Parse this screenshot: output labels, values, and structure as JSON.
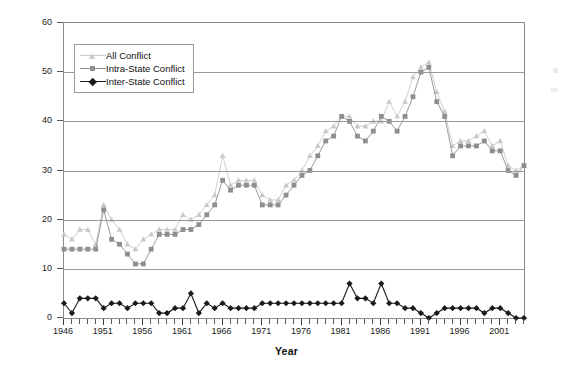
{
  "chart_data": {
    "type": "line",
    "title": "",
    "xlabel": "Year",
    "ylabel": "Number of Conflicts",
    "xlim": [
      1946,
      2004
    ],
    "ylim": [
      0,
      60
    ],
    "ytick_step": 10,
    "yticks": [
      0,
      10,
      20,
      30,
      40,
      50,
      60
    ],
    "xticks_labeled": [
      1946,
      1951,
      1956,
      1961,
      1966,
      1971,
      1976,
      1981,
      1986,
      1991,
      1996,
      2001
    ],
    "xtick_step": 1,
    "grid": "horizontal",
    "legend_position": "top-left",
    "x": [
      1946,
      1947,
      1948,
      1949,
      1950,
      1951,
      1952,
      1953,
      1954,
      1955,
      1956,
      1957,
      1958,
      1959,
      1960,
      1961,
      1962,
      1963,
      1964,
      1965,
      1966,
      1967,
      1968,
      1969,
      1970,
      1971,
      1972,
      1973,
      1974,
      1975,
      1976,
      1977,
      1978,
      1979,
      1980,
      1981,
      1982,
      1983,
      1984,
      1985,
      1986,
      1987,
      1988,
      1989,
      1990,
      1991,
      1992,
      1993,
      1994,
      1995,
      1996,
      1997,
      1998,
      1999,
      2000,
      2001,
      2002,
      2003,
      2004
    ],
    "series": [
      {
        "name": "All Conflict",
        "color": "#c9c9cd",
        "marker": "triangle",
        "values": [
          17,
          16,
          18,
          18,
          15,
          23,
          20,
          18,
          15,
          14,
          16,
          17,
          18,
          18,
          18,
          21,
          20,
          21,
          23,
          25,
          33,
          27,
          28,
          28,
          28,
          25,
          24,
          24,
          27,
          28,
          30,
          33,
          35,
          38,
          39,
          41,
          41,
          39,
          39,
          40,
          40,
          44,
          41,
          44,
          49,
          51,
          52,
          46,
          42,
          35,
          36,
          36,
          37,
          38,
          35,
          36,
          31,
          30,
          31
        ]
      },
      {
        "name": "Intra-State Conflict",
        "color": "#8e8e92",
        "marker": "square",
        "values": [
          14,
          14,
          14,
          14,
          14,
          22,
          16,
          15,
          13,
          11,
          11,
          14,
          17,
          17,
          17,
          18,
          18,
          19,
          21,
          23,
          28,
          26,
          27,
          27,
          27,
          23,
          23,
          23,
          25,
          27,
          29,
          30,
          33,
          36,
          37,
          41,
          40,
          37,
          36,
          38,
          41,
          40,
          38,
          41,
          45,
          50,
          51,
          44,
          41,
          33,
          35,
          35,
          35,
          36,
          34,
          34,
          30,
          29,
          31
        ]
      },
      {
        "name": "Inter-State Conflict",
        "color": "#1b1b1b",
        "marker": "diamond",
        "values": [
          3,
          1,
          4,
          4,
          4,
          2,
          3,
          3,
          2,
          3,
          3,
          3,
          1,
          1,
          2,
          2,
          5,
          1,
          3,
          2,
          3,
          2,
          2,
          2,
          2,
          3,
          3,
          3,
          3,
          3,
          3,
          3,
          3,
          3,
          3,
          3,
          7,
          4,
          4,
          3,
          7,
          3,
          3,
          2,
          2,
          1,
          0,
          1,
          2,
          2,
          2,
          2,
          2,
          1,
          2,
          2,
          1,
          0,
          0
        ]
      }
    ]
  },
  "legend": {
    "items": [
      {
        "label": "All Conflict"
      },
      {
        "label": "Intra-State Conflict"
      },
      {
        "label": "Inter-State Conflict"
      }
    ]
  }
}
